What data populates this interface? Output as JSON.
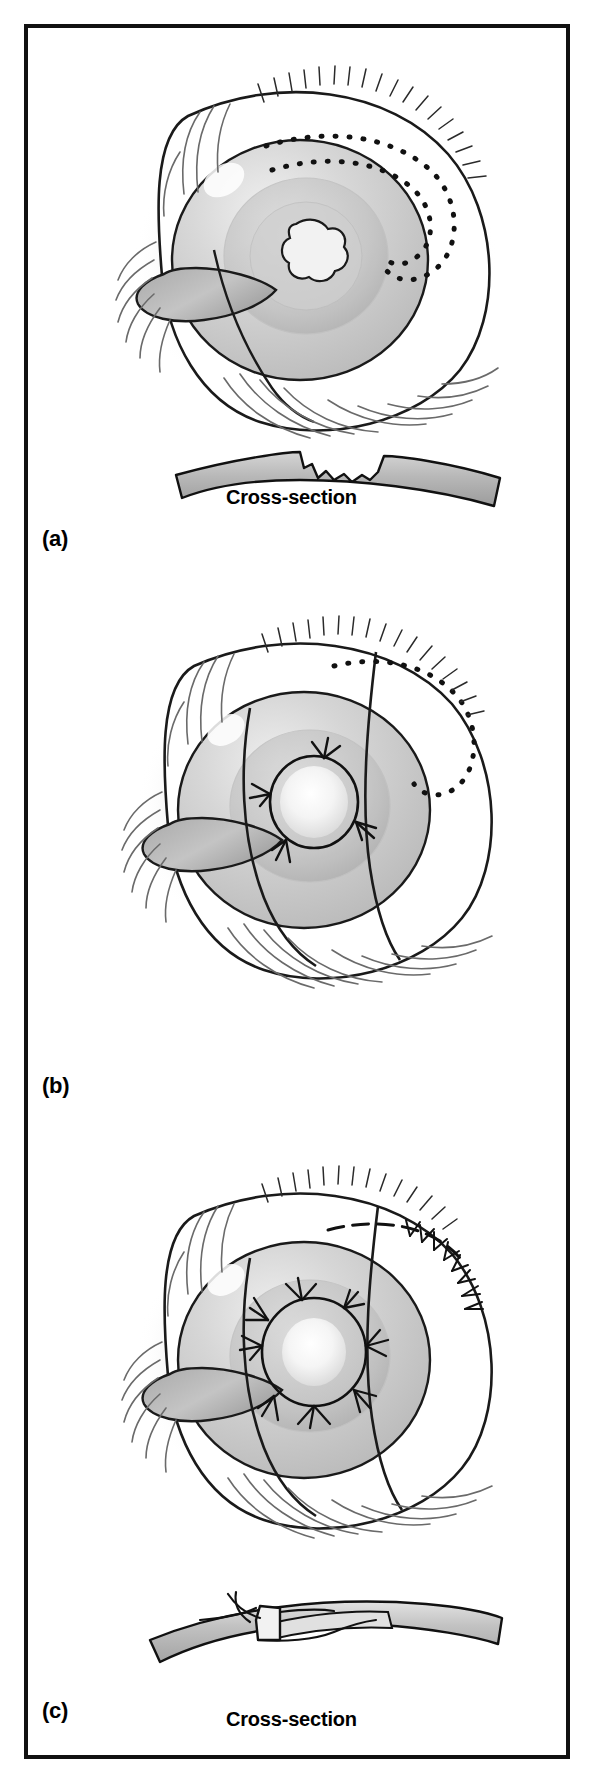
{
  "figure": {
    "domain": "medical-surgical-illustration",
    "title_text": "",
    "border_color": "#111111",
    "background_color": "#ffffff",
    "ink_color": "#1a1a1a",
    "tissue_fill_light": "#e8e8e8",
    "tissue_fill_mid": "#c9c9c9",
    "tissue_fill_dark": "#a8a8a8",
    "shadow_color": "#b0b0b0",
    "width_px": 594,
    "height_px": 1783
  },
  "panels": [
    {
      "id": "a",
      "label": "(a)",
      "caption": "Cross-section",
      "has_cross_section": true,
      "description": "Eye with corneal lesion, dotted outline of donor graft marked on upper sclera; cross-section shows an excavated stromal defect in the cornea",
      "features": {
        "lesion_shape": "irregular-stellate",
        "dotted_marking": "donor-graft-outline",
        "eyelashes": true,
        "sutures": 0
      }
    },
    {
      "id": "b",
      "label": "(b)",
      "caption": "",
      "has_cross_section": false,
      "description": "Graft rotated into position over the corneal defect and anchored with interrupted sutures; dotted donor-site outline still visible superiorly",
      "features": {
        "lesion_shape": "round-defect-covered",
        "dotted_marking": "donor-site-outline",
        "eyelashes": true,
        "sutures": 4
      }
    },
    {
      "id": "c",
      "label": "(c)",
      "caption": "Cross-section",
      "has_cross_section": true,
      "description": "Completed repair: graft sutured circumferentially over the defect and the donor site closed with a running suture line; cross-section shows the graft lamella tucked and knotted",
      "features": {
        "lesion_shape": "round-defect-covered",
        "dotted_marking": "donor-site-closed-dashed",
        "eyelashes": true,
        "sutures": 9
      }
    }
  ],
  "icons": {
    "eyelash": "eyelash-stroke",
    "suture": "suture-knot",
    "dotted_outline": "dotted-graft-outline"
  }
}
